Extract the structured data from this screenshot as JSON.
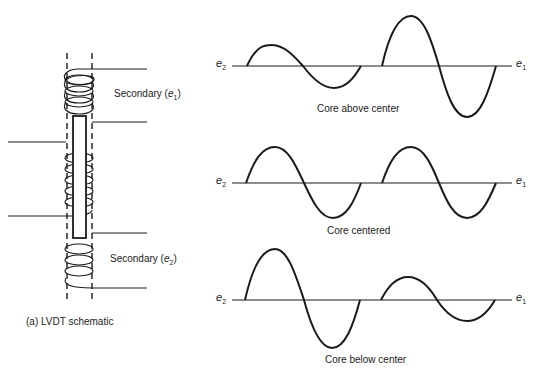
{
  "schematic": {
    "caption": "(a)  LVDT schematic",
    "secondary_top": {
      "text": "Secondary (",
      "var": "e",
      "sub": "1",
      "close": ")"
    },
    "secondary_bottom": {
      "text": "Secondary (",
      "var": "e",
      "sub": "2",
      "close": ")"
    }
  },
  "waveforms": [
    {
      "caption": "Core above center",
      "left_label": {
        "var": "e",
        "sub": "2"
      },
      "right_label": {
        "var": "e",
        "sub": "1"
      },
      "e2_amplitude": "small",
      "e1_amplitude": "large"
    },
    {
      "caption": "Core centered",
      "left_label": {
        "var": "e",
        "sub": "2"
      },
      "right_label": {
        "var": "e",
        "sub": "1"
      },
      "e2_amplitude": "equal",
      "e1_amplitude": "equal"
    },
    {
      "caption": "Core below center",
      "left_label": {
        "var": "e",
        "sub": "2"
      },
      "right_label": {
        "var": "e",
        "sub": "1"
      },
      "e2_amplitude": "large",
      "e1_amplitude": "small"
    }
  ]
}
